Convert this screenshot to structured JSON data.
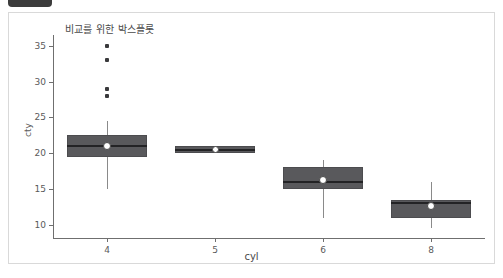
{
  "window": {
    "tab_shape": "dark-rounded-tab"
  },
  "chart_data": {
    "type": "box",
    "title": "비교를 위한 박스플롯",
    "xlabel": "cyl",
    "ylabel": "cty",
    "categories": [
      "4",
      "5",
      "6",
      "8"
    ],
    "xtick_labels": [
      "4",
      "5",
      "6",
      "8"
    ],
    "ytick_labels": [
      "10",
      "15",
      "20",
      "25",
      "30",
      "35"
    ],
    "ytick_values": [
      10,
      15,
      20,
      25,
      30,
      35
    ],
    "ylim": [
      8.0,
      36.5
    ],
    "grid": false,
    "legend": false,
    "colors": {
      "box_fill": "#59595c",
      "box_edge": "#4c4c4f",
      "median": "#232325",
      "whisker": "#8a8a8a",
      "mean_marker": "#ffffff",
      "outlier": "#3a3a3c",
      "axis": "#6f6f6f",
      "panel_border": "#d9d9d9",
      "background": "#ffffff"
    },
    "boxes": [
      {
        "category": "4",
        "whisker_low": 15.0,
        "q1": 19.5,
        "median": 21.0,
        "q3": 22.5,
        "whisker_high": 24.5,
        "mean": 21.0,
        "outliers": [
          35.0,
          33.0,
          29.0,
          28.0
        ]
      },
      {
        "category": "5",
        "whisker_low": 20.0,
        "q1": 20.0,
        "median": 20.5,
        "q3": 21.0,
        "whisker_high": 21.0,
        "mean": 20.5,
        "outliers": []
      },
      {
        "category": "6",
        "whisker_low": 11.0,
        "q1": 15.0,
        "median": 16.0,
        "q3": 18.0,
        "whisker_high": 19.0,
        "mean": 16.2,
        "outliers": []
      },
      {
        "category": "8",
        "whisker_low": 9.5,
        "q1": 11.0,
        "median": 13.0,
        "q3": 13.5,
        "whisker_high": 16.0,
        "mean": 12.6,
        "outliers": []
      }
    ]
  }
}
